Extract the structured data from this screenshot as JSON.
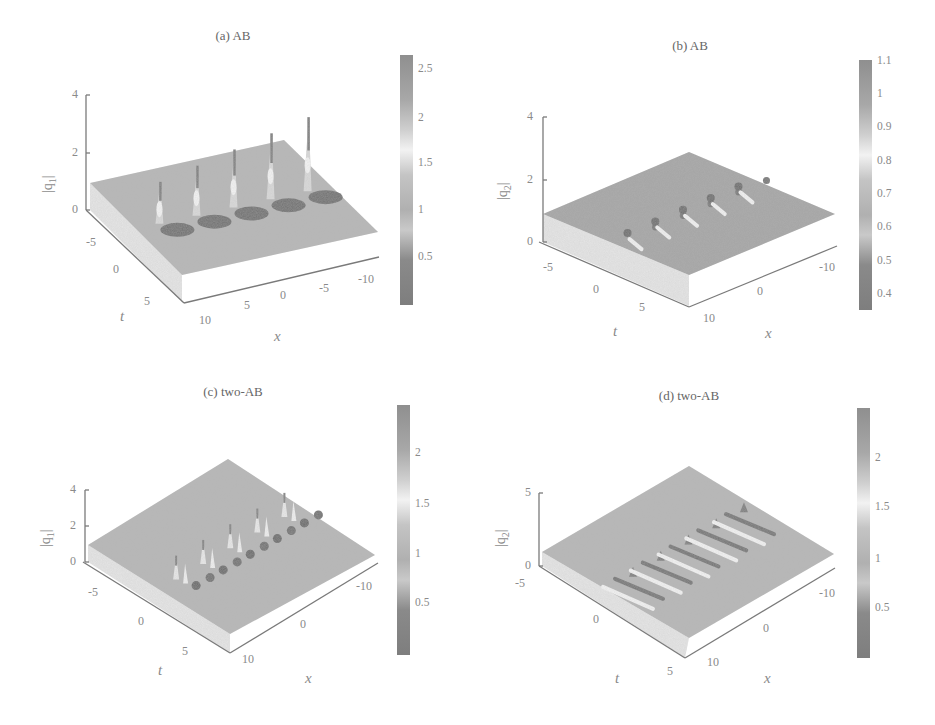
{
  "figure": {
    "panels": [
      {
        "id": "a",
        "title": "(a) AB",
        "zlabel_main": "|q",
        "zlabel_sub": "1",
        "zlabel_end": "|",
        "z_ticks": [
          "4",
          "2",
          "0"
        ],
        "t_ticks": [
          "-5",
          "0",
          "5"
        ],
        "x_ticks": [
          "10",
          "5",
          "0",
          "-5",
          "-10"
        ],
        "t_label": "t",
        "x_label": "x",
        "colorbar_ticks": [
          "2.5",
          "2",
          "1.5",
          "1",
          "0.5"
        ]
      },
      {
        "id": "b",
        "title": "(b) AB",
        "zlabel_main": "|q",
        "zlabel_sub": "2",
        "zlabel_end": "|",
        "z_ticks": [
          "4",
          "2",
          "0"
        ],
        "t_ticks": [
          "-5",
          "0",
          "5"
        ],
        "x_ticks": [
          "10",
          "0",
          "-10"
        ],
        "t_label": "t",
        "x_label": "x",
        "colorbar_ticks": [
          "1.1",
          "1",
          "0.9",
          "0.8",
          "0.7",
          "0.6",
          "0.5",
          "0.4"
        ]
      },
      {
        "id": "c",
        "title": "(c) two-AB",
        "zlabel_main": "|q",
        "zlabel_sub": "1",
        "zlabel_end": "|",
        "z_ticks": [
          "4",
          "2",
          "0"
        ],
        "t_ticks": [
          "-5",
          "0",
          "5"
        ],
        "x_ticks": [
          "10",
          "0",
          "-10"
        ],
        "t_label": "t",
        "x_label": "x",
        "colorbar_ticks": [
          "2",
          "1.5",
          "1",
          "0.5"
        ]
      },
      {
        "id": "d",
        "title": "(d) two-AB",
        "zlabel_main": "|q",
        "zlabel_sub": "2",
        "zlabel_end": "|",
        "z_ticks": [
          "5",
          "0"
        ],
        "t_ticks": [
          "-5",
          "0",
          "5"
        ],
        "x_ticks": [
          "10",
          "0",
          "-10"
        ],
        "t_label": "t",
        "x_label": "x",
        "colorbar_ticks": [
          "2",
          "1.5",
          "1",
          "0.5"
        ]
      }
    ]
  },
  "chart_data": [
    {
      "type": "surface",
      "title": "(a) AB",
      "xlabel": "x",
      "ylabel": "t",
      "zlabel": "|q1|",
      "x_ticks": [
        10,
        5,
        0,
        -5,
        -10
      ],
      "t_ticks": [
        -5,
        0,
        5
      ],
      "z_ticks": [
        0,
        2,
        4
      ],
      "zlim": [
        0,
        4
      ],
      "colorbar": {
        "ticks": [
          0.5,
          1,
          1.5,
          2,
          2.5
        ],
        "range": [
          0.05,
          2.65
        ],
        "colormap": "grayscale"
      },
      "background_level": 1.0,
      "features": "Akhmediev breather: periodic chain of 5 peaks along x (max ~2.6) with adjacent dips (~0.1) near t=0",
      "peaks_approx": [
        {
          "x": 10,
          "z": 2.0
        },
        {
          "x": 5,
          "z": 2.2
        },
        {
          "x": 0,
          "z": 2.3
        },
        {
          "x": -5,
          "z": 2.5
        },
        {
          "x": -10,
          "z": 2.6
        }
      ]
    },
    {
      "type": "surface",
      "title": "(b) AB",
      "xlabel": "x",
      "ylabel": "t",
      "zlabel": "|q2|",
      "x_ticks": [
        10,
        0,
        -10
      ],
      "t_ticks": [
        -5,
        0,
        5
      ],
      "z_ticks": [
        0,
        2,
        4
      ],
      "zlim": [
        0,
        4
      ],
      "colorbar": {
        "ticks": [
          0.4,
          0.5,
          0.6,
          0.7,
          0.8,
          0.9,
          1.0,
          1.1
        ],
        "range": [
          0.35,
          1.1
        ],
        "colormap": "grayscale"
      },
      "background_level": 0.9,
      "features": "Periodic chain of 4-5 small bumps/dips along x near t=0, amplitude range ~0.35-1.1"
    },
    {
      "type": "surface",
      "title": "(c) two-AB",
      "xlabel": "x",
      "ylabel": "t",
      "zlabel": "|q1|",
      "x_ticks": [
        10,
        0,
        -10
      ],
      "t_ticks": [
        -5,
        0,
        5
      ],
      "z_ticks": [
        0,
        2,
        4
      ],
      "zlim": [
        0,
        4
      ],
      "colorbar": {
        "ticks": [
          0.5,
          1,
          1.5,
          2
        ],
        "range": [
          0.05,
          2.45
        ],
        "colormap": "grayscale"
      },
      "background_level": 1.0,
      "features": "Two interacting Akhmediev breathers: paired periodic peaks (~2.4) and dips along a diagonal band near t=0"
    },
    {
      "type": "surface",
      "title": "(d) two-AB",
      "xlabel": "x",
      "ylabel": "t",
      "zlabel": "|q2|",
      "x_ticks": [
        10,
        0,
        -10
      ],
      "t_ticks": [
        -5,
        0,
        5
      ],
      "z_ticks": [
        0,
        5
      ],
      "zlim": [
        0,
        5
      ],
      "colorbar": {
        "ticks": [
          0.5,
          1,
          1.5,
          2
        ],
        "range": [
          0.05,
          2.45
        ],
        "colormap": "grayscale"
      },
      "background_level": 1.0,
      "features": "Two-AB in second component: elongated stripe-like ridges and troughs periodic along x, oblique to t axis"
    }
  ]
}
